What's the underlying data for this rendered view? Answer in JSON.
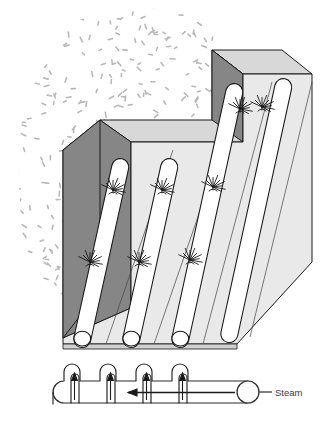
{
  "figure": {
    "name": "steam-pipe-subsurface-heating-diagram",
    "type": "technical-isometric-illustration",
    "background_color": "#ffffff",
    "width": 324,
    "height": 425
  },
  "labels": {
    "steam": "Steam"
  },
  "colors": {
    "outline": "#1a1a1a",
    "block_top_face": "#d8d8d8",
    "block_left_face": "#868686",
    "block_front_face": "#e9e9e9",
    "pipe_fill": "#ffffff",
    "pipe_outline": "#1a1a1a",
    "speckle": "#b8b8b8",
    "label_text": "#3a3a3a",
    "manifold_outline": "#2a2a2a",
    "arrow": "#1a1a1a"
  },
  "geometry": {
    "block": {
      "description": "stepped rectangular block, two levels, upper-right step is taller",
      "levels": 2
    },
    "pipes": {
      "count": 4,
      "description": "four parallel cylindrical pipes running diagonally up the sloped face",
      "lower_pipes": 2,
      "upper_pipes": 2
    },
    "nozzles": {
      "count": 8,
      "per_pipe": 2,
      "description": "radiating spray nozzle fans attached to each pipe"
    },
    "pipe_ends": {
      "count": 4,
      "description": "open circular pipe ends at the bottom edge of the block"
    },
    "manifold": {
      "description": "serpentine steam header with four hairpin risers feeding the pipes",
      "risers": 4,
      "flow_arrows": 5,
      "flow_direction": "right-to-left along header, upward through risers"
    }
  },
  "speckle_field": {
    "description": "stippled dash texture representing soil / granular medium surrounding the block",
    "dash_count": 430,
    "dash_color": "#b8b8b8"
  },
  "caption": {
    "fragment": ""
  }
}
